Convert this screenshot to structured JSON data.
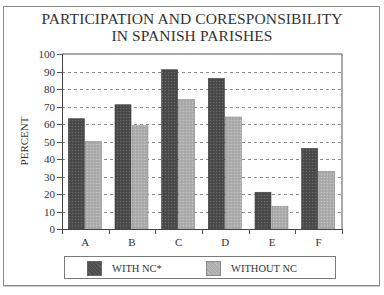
{
  "chart_data": {
    "type": "bar",
    "title": "PARTICIPATION AND CORESPONSIBILITY IN SPANISH PARISHES",
    "title_lines": [
      "PARTICIPATION AND CORESPONSIBILITY",
      "IN SPANISH PARISHES"
    ],
    "xlabel": "",
    "ylabel": "PERCENT",
    "categories": [
      "A",
      "B",
      "C",
      "D",
      "E",
      "F"
    ],
    "series": [
      {
        "name": "WITH NC*",
        "color": "#4a4a4a",
        "values": [
          63,
          71,
          91,
          86,
          21,
          46
        ]
      },
      {
        "name": "WITHOUT NC",
        "color": "#ababab",
        "values": [
          50,
          59,
          74,
          64,
          13,
          33
        ]
      }
    ],
    "ylim": [
      0,
      100
    ],
    "yticks": [
      0,
      10,
      20,
      30,
      40,
      50,
      60,
      70,
      80,
      90,
      100
    ],
    "grid": "dashed horizontal",
    "legend_position": "bottom"
  }
}
